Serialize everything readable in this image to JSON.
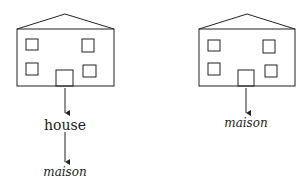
{
  "diagram": {
    "left": {
      "label_word": "house",
      "label_translation": "maison"
    },
    "right": {
      "label_translation": "maison"
    },
    "colors": {
      "stroke": "#222222",
      "background": "#ffffff"
    }
  }
}
